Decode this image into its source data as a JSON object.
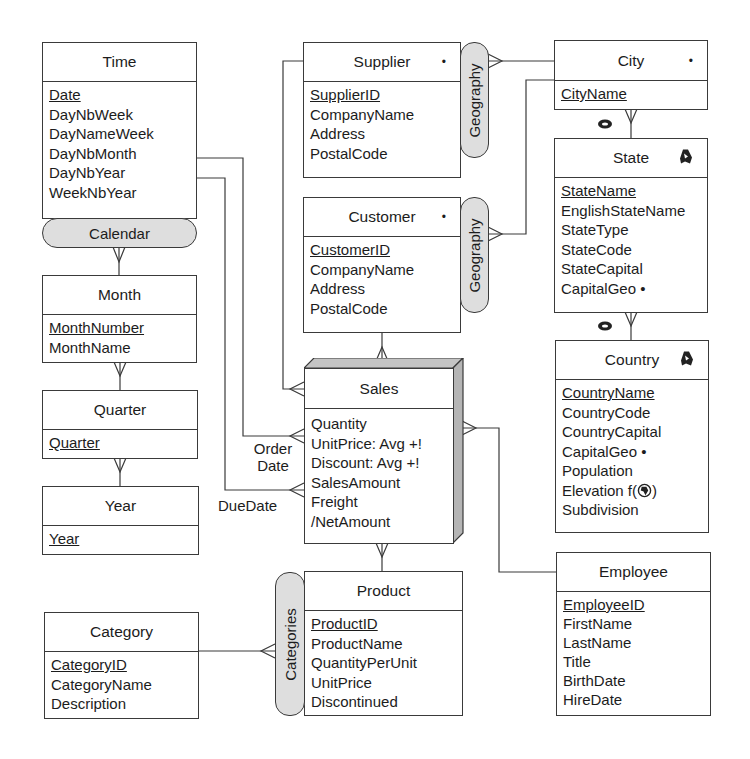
{
  "diagram": {
    "type": "multidimensional-schema",
    "fact": {
      "name": "Sales",
      "measures": [
        "Quantity",
        "UnitPrice: Avg +!",
        "Discount: Avg +!",
        "SalesAmount",
        "Freight",
        "/NetAmount"
      ]
    },
    "levels": {
      "time": {
        "name": "Time",
        "key": "Date",
        "attributes": [
          "DayNbWeek",
          "DayNameWeek",
          "DayNbMonth",
          "DayNbYear",
          "WeekNbYear"
        ]
      },
      "month": {
        "name": "Month",
        "key": "MonthNumber",
        "attributes": [
          "MonthName"
        ]
      },
      "quarter": {
        "name": "Quarter",
        "key": "Quarter",
        "attributes": []
      },
      "year": {
        "name": "Year",
        "key": "Year",
        "attributes": []
      },
      "supplier": {
        "name": "Supplier",
        "marker": "•",
        "key": "SupplierID",
        "attributes": [
          "CompanyName",
          "Address",
          "PostalCode"
        ]
      },
      "customer": {
        "name": "Customer",
        "marker": "•",
        "key": "CustomerID",
        "attributes": [
          "CompanyName",
          "Address",
          "PostalCode"
        ]
      },
      "city": {
        "name": "City",
        "marker": "•",
        "key": "CityName",
        "attributes": []
      },
      "state": {
        "name": "State",
        "marker_icon": "region-geometry-icon",
        "key": "StateName",
        "attributes": [
          "EnglishStateName",
          "StateType",
          "StateCode",
          "StateCapital",
          "CapitalGeo •"
        ]
      },
      "country": {
        "name": "Country",
        "marker_icon": "region-geometry-icon",
        "key": "CountryName",
        "attributes": [
          "CountryCode",
          "CountryCapital",
          "CapitalGeo •",
          "Population",
          "Elevation f(",
          "Subdivision"
        ]
      },
      "product": {
        "name": "Product",
        "key": "ProductID",
        "attributes": [
          "ProductName",
          "QuantityPerUnit",
          "UnitPrice",
          "Discontinued"
        ]
      },
      "category": {
        "name": "Category",
        "key": "CategoryID",
        "attributes": [
          "CategoryName",
          "Description"
        ]
      },
      "employee": {
        "name": "Employee",
        "key": "EmployeeID",
        "attributes": [
          "FirstName",
          "LastName",
          "Title",
          "BirthDate",
          "HireDate"
        ]
      }
    },
    "elevation_suffix": ")",
    "hierarchies": {
      "calendar": "Calendar",
      "geography_supplier": "Geography",
      "geography_customer": "Geography",
      "categories": "Categories"
    },
    "roles": {
      "order_date_line1": "Order",
      "order_date_line2": "Date",
      "due_date": "DueDate"
    },
    "colors": {
      "line": "#3a3a3a",
      "pill_fill": "#dedede",
      "fact_side": "#b5b5b5",
      "background": "#ffffff"
    }
  }
}
